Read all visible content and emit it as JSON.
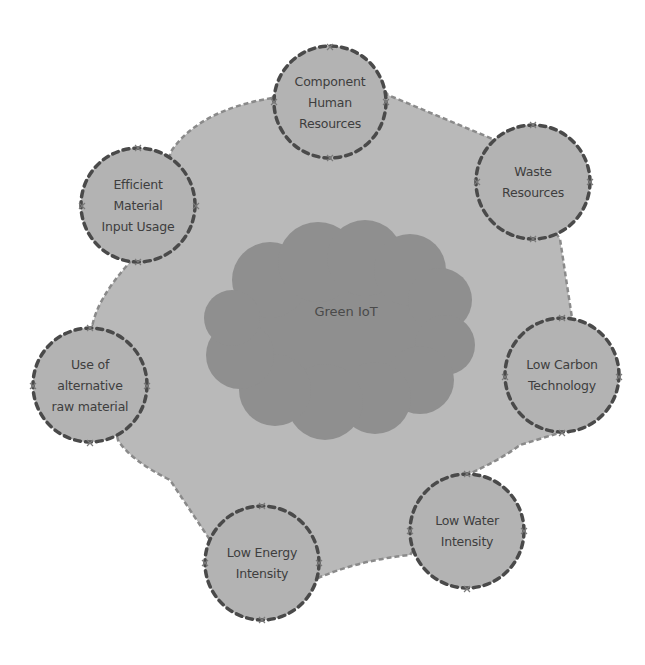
{
  "diagram": {
    "center": {
      "label": "Green IoT",
      "x": 346,
      "y": 311
    },
    "nodes": [
      {
        "id": "component-human-resources",
        "label": "Component\nHuman\nResources",
        "lines": [
          "Component",
          "Human",
          "Resources"
        ],
        "x": 330,
        "y": 102
      },
      {
        "id": "waste-resources",
        "label": "Waste\nResources",
        "lines": [
          "Waste",
          "Resources"
        ],
        "x": 533,
        "y": 182
      },
      {
        "id": "low-carbon-technology",
        "label": "Low Carbon\nTechnology",
        "lines": [
          "Low Carbon",
          "Technology"
        ],
        "x": 562,
        "y": 375
      },
      {
        "id": "low-water-intensity",
        "label": "Low Water\nIntensity",
        "lines": [
          "Low Water",
          "Intensity"
        ],
        "x": 467,
        "y": 531
      },
      {
        "id": "low-energy-intensity",
        "label": "Low Energy\nIntensity",
        "lines": [
          "Low Energy",
          "Intensity"
        ],
        "x": 262,
        "y": 563
      },
      {
        "id": "use-of-alternative-raw-material",
        "label": "Use of\nalternative\nraw material",
        "lines": [
          "Use of",
          "alternative",
          "raw material"
        ],
        "x": 90,
        "y": 385
      },
      {
        "id": "efficient-material-input-usage",
        "label": "Efficient\nMaterial\nInput Usage",
        "lines": [
          "Efficient",
          "Material",
          "Input Usage"
        ],
        "x": 138,
        "y": 205
      }
    ],
    "colors": {
      "outer_fill": "#b9b9b9",
      "node_fill": "#b3b3b3",
      "node_stroke": "#4a4a4a",
      "outer_stroke": "#8a8a8a",
      "cloud_fill": "#8f8f8f",
      "text": "#3e3e3e"
    }
  }
}
